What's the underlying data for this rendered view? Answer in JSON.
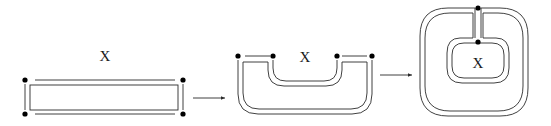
{
  "diagram": {
    "type": "topological-transformation-sequence",
    "stages": [
      {
        "id": "stage-1",
        "shape": "flat-band-rectangle",
        "label": "X",
        "endpoints": 4
      },
      {
        "id": "stage-2",
        "shape": "U-shaped-band",
        "label": "X",
        "endpoints": 4
      },
      {
        "id": "stage-3",
        "shape": "nested-annular-band",
        "label": "X",
        "endpoints": 2
      }
    ],
    "arrows": [
      {
        "from": "stage-1",
        "to": "stage-2"
      },
      {
        "from": "stage-2",
        "to": "stage-3"
      }
    ],
    "colors": {
      "stroke": "#2b2b2b",
      "dot": "#000000",
      "background": "#ffffff"
    }
  }
}
